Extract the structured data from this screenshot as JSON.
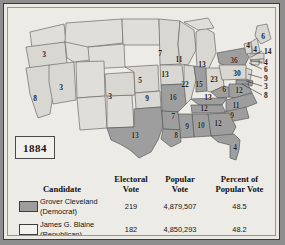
{
  "year_label": "1884",
  "colors": {
    "democrat_fill": "#9d9d9d",
    "republican_fill": "#d8d6d0",
    "territory_fill": "#dedcd6",
    "water": "#edebe6",
    "outline": "#5a5a5a",
    "frame": "#8e8e8e",
    "text": "#161616"
  },
  "map": {
    "title_hidden": "",
    "state_labels": [
      {
        "state": "oregon",
        "votes": "3",
        "x": 36,
        "y": 46,
        "party": "republican"
      },
      {
        "state": "california",
        "votes": "8",
        "x": 27,
        "y": 90,
        "party": "republican"
      },
      {
        "state": "nevada",
        "votes": "3",
        "x": 53,
        "y": 79,
        "party": "republican"
      },
      {
        "state": "colorado",
        "votes": "3",
        "x": 102,
        "y": 88,
        "party": "republican"
      },
      {
        "state": "nebraska",
        "votes": "5",
        "x": 132,
        "y": 72,
        "party": "republican"
      },
      {
        "state": "kansas",
        "votes": "9",
        "x": 139,
        "y": 90,
        "party": "republican"
      },
      {
        "state": "minnesota",
        "votes": "7",
        "x": 152,
        "y": 45,
        "party": "republican"
      },
      {
        "state": "iowa",
        "votes": "13",
        "x": 157,
        "y": 66,
        "party": "republican"
      },
      {
        "state": "wisconsin",
        "votes": "11",
        "x": 171,
        "y": 51,
        "party": "republican"
      },
      {
        "state": "michigan",
        "votes": "13",
        "x": 194,
        "y": 56,
        "party": "republican"
      },
      {
        "state": "missouri",
        "votes": "16",
        "x": 165,
        "y": 89,
        "party": "democrat"
      },
      {
        "state": "illinois",
        "votes": "22",
        "x": 177,
        "y": 76,
        "party": "republican"
      },
      {
        "state": "indiana",
        "votes": "15",
        "x": 191,
        "y": 76,
        "party": "democrat"
      },
      {
        "state": "ohio",
        "votes": "23",
        "x": 206,
        "y": 71,
        "party": "republican"
      },
      {
        "state": "new-york",
        "votes": "36",
        "x": 226,
        "y": 52,
        "party": "democrat"
      },
      {
        "state": "pennsylvania",
        "votes": "30",
        "x": 229,
        "y": 65,
        "party": "republican"
      },
      {
        "state": "maine",
        "votes": "6",
        "x": 255,
        "y": 28,
        "party": "republican"
      },
      {
        "state": "vermont",
        "votes": "4",
        "x": 240,
        "y": 37,
        "party": "republican"
      },
      {
        "state": "new-hampshire",
        "votes": "4",
        "x": 247,
        "y": 41,
        "party": "republican"
      },
      {
        "state": "west-virginia",
        "votes": "6",
        "x": 216,
        "y": 81,
        "party": "democrat"
      },
      {
        "state": "virginia",
        "votes": "12",
        "x": 231,
        "y": 82,
        "party": "democrat"
      },
      {
        "state": "kentucky",
        "votes": "13",
        "x": 200,
        "y": 89,
        "party": "democrat"
      },
      {
        "state": "tennessee",
        "votes": "12",
        "x": 196,
        "y": 100,
        "party": "democrat"
      },
      {
        "state": "north-carolina",
        "votes": "11",
        "x": 228,
        "y": 97,
        "party": "democrat"
      },
      {
        "state": "south-carolina",
        "votes": "9",
        "x": 224,
        "y": 107,
        "party": "democrat"
      },
      {
        "state": "georgia",
        "votes": "12",
        "x": 210,
        "y": 115,
        "party": "democrat"
      },
      {
        "state": "alabama",
        "votes": "10",
        "x": 193,
        "y": 117,
        "party": "democrat"
      },
      {
        "state": "mississippi",
        "votes": "9",
        "x": 179,
        "y": 118,
        "party": "democrat"
      },
      {
        "state": "arkansas",
        "votes": "7",
        "x": 165,
        "y": 108,
        "party": "democrat"
      },
      {
        "state": "louisiana",
        "votes": "8",
        "x": 168,
        "y": 127,
        "party": "democrat"
      },
      {
        "state": "florida",
        "votes": "4",
        "x": 227,
        "y": 139,
        "party": "democrat"
      },
      {
        "state": "texas",
        "votes": "13",
        "x": 127,
        "y": 127,
        "party": "democrat"
      }
    ],
    "callouts": [
      {
        "state": "massachusetts",
        "votes": "14",
        "x": 259,
        "y": 43
      },
      {
        "state": "rhode-island",
        "votes": "4",
        "x": 259,
        "y": 54
      },
      {
        "state": "connecticut",
        "votes": "6",
        "x": 259,
        "y": 61
      },
      {
        "state": "new-jersey",
        "votes": "9",
        "x": 259,
        "y": 70
      },
      {
        "state": "delaware",
        "votes": "3",
        "x": 259,
        "y": 78
      },
      {
        "state": "maryland",
        "votes": "8",
        "x": 259,
        "y": 87
      }
    ]
  },
  "table": {
    "headers": {
      "candidate": "Candidate",
      "electoral_vote": "Electoral\nVote",
      "electoral_vote_l1": "Electoral",
      "electoral_vote_l2": "Vote",
      "popular_vote_l1": "Popular",
      "popular_vote_l2": "Vote",
      "percent_l1": "Percent of",
      "percent_l2": "Popular Vote"
    },
    "rows": [
      {
        "swatch": "democrat",
        "name_line1": "Grover Cleveland",
        "name_line2": "(Democrat)",
        "electoral_vote": "219",
        "popular_vote": "4,879,507",
        "percent": "48.5"
      },
      {
        "swatch": "republican",
        "name_line1": "James G. Blaine",
        "name_line2": "(Republican)",
        "electoral_vote": "182",
        "popular_vote": "4,850,293",
        "percent": "48.2"
      }
    ]
  }
}
